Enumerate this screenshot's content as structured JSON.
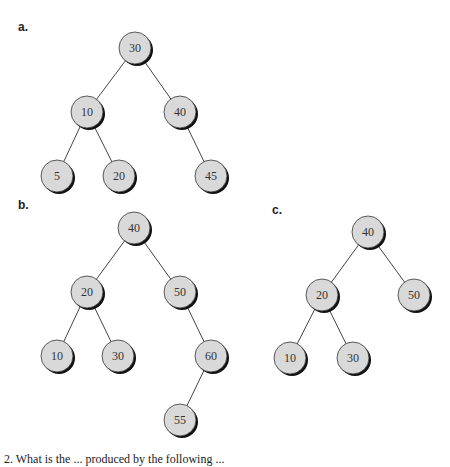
{
  "colors": {
    "node_fill": "#d9d9d9",
    "node_stroke": "#333333",
    "shadow": "#111111",
    "edge": "#444444"
  },
  "node_radius": 16,
  "trees": [
    {
      "label": "a.",
      "label_pos": [
        18,
        20
      ],
      "nodes": [
        {
          "id": "a30",
          "value": "30",
          "x": 135,
          "y": 48
        },
        {
          "id": "a10",
          "value": "10",
          "x": 87,
          "y": 112
        },
        {
          "id": "a40",
          "value": "40",
          "x": 180,
          "y": 112
        },
        {
          "id": "a5",
          "value": "5",
          "x": 57,
          "y": 176
        },
        {
          "id": "a20",
          "value": "20",
          "x": 119,
          "y": 176
        },
        {
          "id": "a45",
          "value": "45",
          "x": 211,
          "y": 176
        }
      ],
      "edges": [
        [
          "a30",
          "a10"
        ],
        [
          "a30",
          "a40"
        ],
        [
          "a10",
          "a5"
        ],
        [
          "a10",
          "a20"
        ],
        [
          "a40",
          "a45"
        ]
      ]
    },
    {
      "label": "b.",
      "label_pos": [
        18,
        198
      ],
      "nodes": [
        {
          "id": "b40",
          "value": "40",
          "x": 134,
          "y": 228
        },
        {
          "id": "b20",
          "value": "20",
          "x": 87,
          "y": 292
        },
        {
          "id": "b50",
          "value": "50",
          "x": 180,
          "y": 292
        },
        {
          "id": "b10",
          "value": "10",
          "x": 57,
          "y": 356
        },
        {
          "id": "b30",
          "value": "30",
          "x": 118,
          "y": 356
        },
        {
          "id": "b60",
          "value": "60",
          "x": 211,
          "y": 356
        },
        {
          "id": "b55",
          "value": "55",
          "x": 180,
          "y": 420
        }
      ],
      "edges": [
        [
          "b40",
          "b20"
        ],
        [
          "b40",
          "b50"
        ],
        [
          "b20",
          "b10"
        ],
        [
          "b20",
          "b30"
        ],
        [
          "b50",
          "b60"
        ],
        [
          "b60",
          "b55"
        ]
      ]
    },
    {
      "label": "c.",
      "label_pos": [
        272,
        203
      ],
      "nodes": [
        {
          "id": "c40",
          "value": "40",
          "x": 368,
          "y": 232
        },
        {
          "id": "c20",
          "value": "20",
          "x": 322,
          "y": 295
        },
        {
          "id": "c50",
          "value": "50",
          "x": 414,
          "y": 295
        },
        {
          "id": "c10",
          "value": "10",
          "x": 290,
          "y": 358
        },
        {
          "id": "c30",
          "value": "30",
          "x": 353,
          "y": 358
        }
      ],
      "edges": [
        [
          "c40",
          "c20"
        ],
        [
          "c40",
          "c50"
        ],
        [
          "c20",
          "c10"
        ],
        [
          "c20",
          "c30"
        ]
      ]
    }
  ],
  "caption": "2. What is the ... produced by the following ..."
}
